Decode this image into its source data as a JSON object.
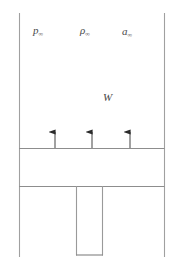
{
  "figure": {
    "type": "engineering-flow-diagram",
    "background_color": "#ffffff",
    "line_color": "#9a9a9a",
    "line_color_dark": "#8a8a8a",
    "text_color": "#4a4a4a",
    "arrow_color": "#2b2b2b",
    "width": 178,
    "height": 270
  },
  "labels": {
    "pressure": {
      "symbol": "p",
      "subscript": "∞",
      "full": "p∞"
    },
    "density": {
      "symbol": "ρ",
      "subscript": "∞",
      "full": "ρ∞"
    },
    "sound_speed": {
      "symbol": "a",
      "subscript": "∞",
      "full": "a∞"
    },
    "velocity": {
      "symbol": "W",
      "subscript": "",
      "full": "W"
    }
  },
  "geometry": {
    "outer_left_x": 19,
    "outer_right_x": 164,
    "outer_top_y": 13,
    "outer_bottom_y": 257,
    "wall_upper_y": 148,
    "wall_lower_y": 186,
    "plug_left_x": 76,
    "plug_right_x": 102,
    "plug_bottom_y": 255
  },
  "arrows": {
    "count": 3,
    "direction": "up",
    "x_positions": [
      55,
      92,
      130
    ],
    "tail_y": 148,
    "head_y": 126
  }
}
